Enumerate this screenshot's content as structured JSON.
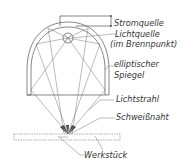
{
  "diagram": {
    "type": "schematic",
    "labels": {
      "power_source": "Stromquelle",
      "light_source_line1": "Lichtquelle",
      "light_source_line2": "(im Brennpunkt)",
      "mirror_line1": "elliptischer",
      "mirror_line2": "Spiegel",
      "light_beam": "Lichtstrahl",
      "weld_seam": "Schweißnaht",
      "workpiece": "Werkstück"
    },
    "colors": {
      "line": "#555555",
      "text": "#333333",
      "background": "#ffffff"
    }
  }
}
